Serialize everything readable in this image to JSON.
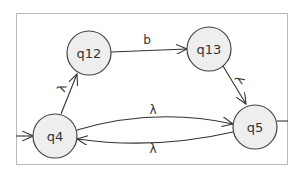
{
  "diagram": {
    "type": "finite-automaton",
    "states": [
      {
        "id": "q12",
        "label": "q12"
      },
      {
        "id": "q13",
        "label": "q13"
      },
      {
        "id": "q4",
        "label": "q4"
      },
      {
        "id": "q5",
        "label": "q5"
      }
    ],
    "transitions": [
      {
        "from": "q12",
        "to": "q13",
        "label": "b"
      },
      {
        "from": "q13",
        "to": "q5",
        "label": "λ"
      },
      {
        "from": "q4",
        "to": "q12",
        "label": "λ"
      },
      {
        "from": "q4",
        "to": "q5",
        "label": "λ"
      },
      {
        "from": "q5",
        "to": "q4",
        "label": "λ"
      }
    ]
  }
}
